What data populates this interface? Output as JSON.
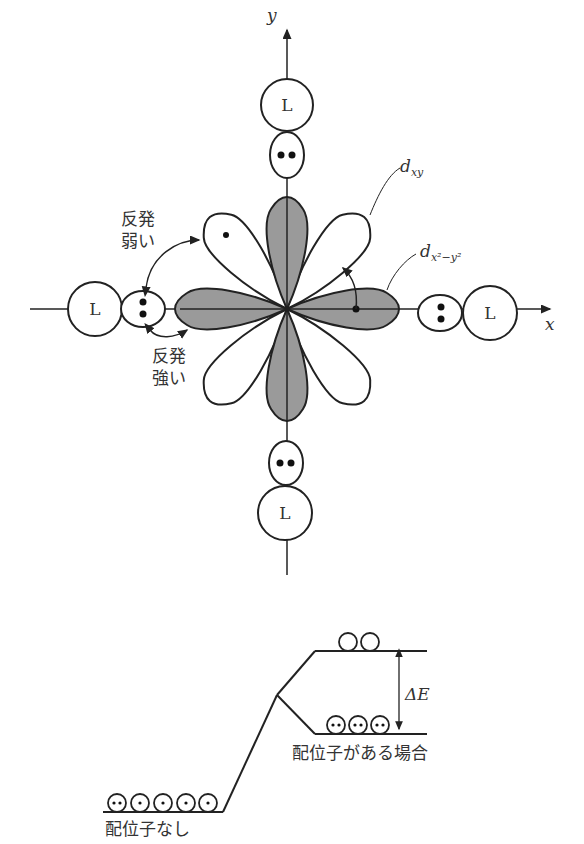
{
  "axes": {
    "x_label": "x",
    "y_label": "y"
  },
  "ligand_label": "L",
  "orbitals": {
    "dxy": {
      "base": "d",
      "sub": "xy"
    },
    "dx2y2": {
      "base": "d",
      "sub": "x²−y²"
    }
  },
  "annotations": {
    "weak_repulsion_line1": "反発",
    "weak_repulsion_line2": "弱い",
    "strong_repulsion_line1": "反発",
    "strong_repulsion_line2": "強い"
  },
  "energy_diagram": {
    "delta_label": "ΔE",
    "no_ligand_label": "配位子なし",
    "with_ligand_label": "配位子がある場合"
  },
  "colors": {
    "line": "#222222",
    "shaded": "#9a9a9a",
    "text": "#333333"
  }
}
